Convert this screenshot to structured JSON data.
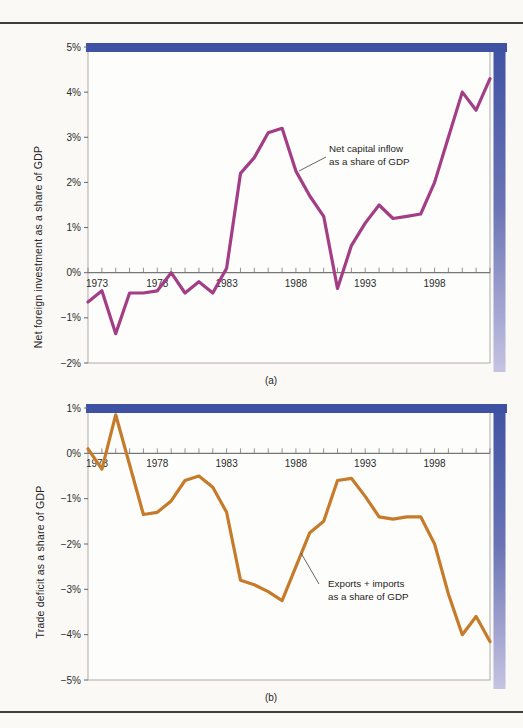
{
  "figure": {
    "caption_a": "(a)",
    "caption_b": "(b)"
  },
  "colors": {
    "line_a": "#a33e86",
    "line_b": "#c67b2a",
    "band_dark": "#3e51a2",
    "band_mid": "#6b74b5",
    "band_light": "#c6c3e2",
    "axis": "#777777",
    "plot_border": "#9a9a98",
    "text": "#2b2b2b",
    "page_bg": "#faf9f6",
    "rule": "#3d3d3d"
  },
  "chart_data": [
    {
      "type": "line",
      "caption": "(a)",
      "ylabel": "Net foreign investment as a share of GDP",
      "xlabel": "",
      "annotation_line1": "Net capital inflow",
      "annotation_line2": "as a share of GDP",
      "line_color": "#a33e86",
      "ylim": [
        -2,
        5
      ],
      "yticks": [
        5,
        4,
        3,
        2,
        1,
        0,
        -1,
        -2
      ],
      "ytick_labels": [
        "5%",
        "4%",
        "3%",
        "2%",
        "1%",
        "0%",
        "−1%",
        "−2%"
      ],
      "xticks_labeled": [
        1973,
        1978,
        1983,
        1988,
        1993,
        1998
      ],
      "grid": false,
      "legend_position": "annotation-with-leader-line",
      "x": [
        1973,
        1974,
        1975,
        1976,
        1977,
        1978,
        1979,
        1980,
        1981,
        1982,
        1983,
        1984,
        1985,
        1986,
        1987,
        1988,
        1989,
        1990,
        1991,
        1992,
        1993,
        1994,
        1995,
        1996,
        1997,
        1998,
        1999,
        2000,
        2001,
        2002
      ],
      "values": [
        -0.65,
        -0.4,
        -1.35,
        -0.45,
        -0.45,
        -0.4,
        0,
        -0.45,
        -0.2,
        -0.45,
        0.1,
        2.2,
        2.55,
        3.1,
        3.2,
        2.25,
        1.7,
        1.25,
        -0.35,
        0.6,
        1.1,
        1.5,
        1.2,
        1.25,
        1.3,
        2.0,
        3.0,
        4.0,
        3.6,
        4.3
      ]
    },
    {
      "type": "line",
      "caption": "(b)",
      "ylabel": "Trade deficit as a share of GDP",
      "xlabel": "",
      "annotation_line1": "Exports + imports",
      "annotation_line2": "as a share of GDP",
      "line_color": "#c67b2a",
      "ylim": [
        -5,
        1
      ],
      "yticks": [
        1,
        0,
        -1,
        -2,
        -3,
        -4,
        -5
      ],
      "ytick_labels": [
        "1%",
        "0%",
        "−1%",
        "−2%",
        "−3%",
        "−4%",
        "−5%"
      ],
      "xticks_labeled": [
        1973,
        1978,
        1983,
        1988,
        1993,
        1998
      ],
      "grid": false,
      "legend_position": "annotation-with-leader-line",
      "x": [
        1973,
        1974,
        1975,
        1976,
        1977,
        1978,
        1979,
        1980,
        1981,
        1982,
        1983,
        1984,
        1985,
        1986,
        1987,
        1988,
        1989,
        1990,
        1991,
        1992,
        1993,
        1994,
        1995,
        1996,
        1997,
        1998,
        1999,
        2000,
        2001,
        2002
      ],
      "values": [
        0.1,
        -0.35,
        0.85,
        -0.25,
        -1.35,
        -1.3,
        -1.05,
        -0.6,
        -0.5,
        -0.75,
        -1.3,
        -2.8,
        -2.9,
        -3.05,
        -3.25,
        -2.5,
        -1.75,
        -1.5,
        -0.6,
        -0.55,
        -0.95,
        -1.4,
        -1.45,
        -1.4,
        -1.4,
        -2.0,
        -3.1,
        -4.0,
        -3.6,
        -4.15
      ]
    }
  ]
}
